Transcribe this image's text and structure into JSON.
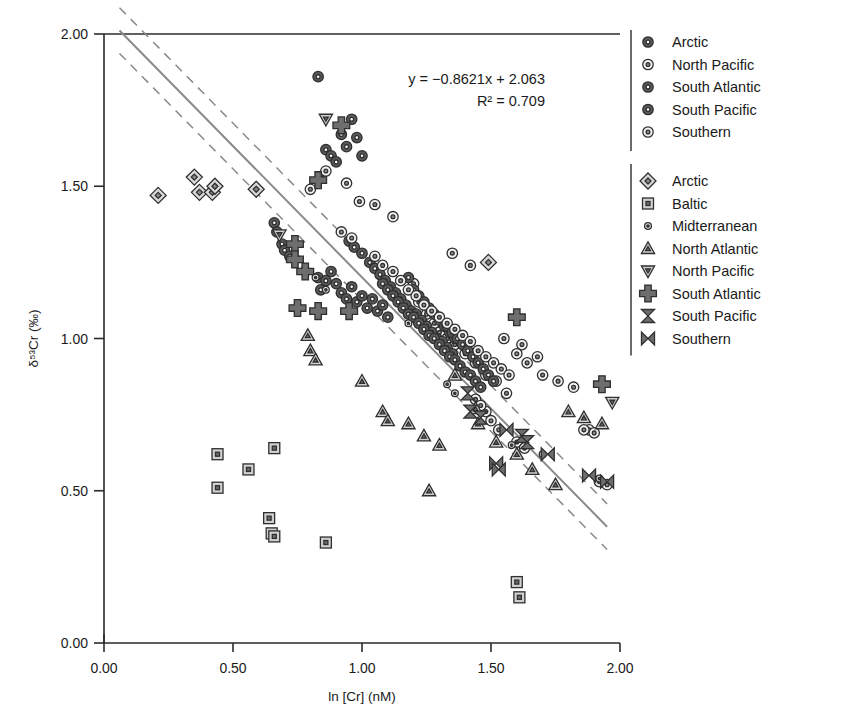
{
  "chart_data": {
    "type": "scatter",
    "title": "",
    "xlabel": "ln [Cr] (nM)",
    "ylabel": "δ⁵³Cr (‰)",
    "xlim": [
      0.0,
      2.0
    ],
    "ylim": [
      0.0,
      2.0
    ],
    "xticks": [
      "0.00",
      "0.50",
      "1.00",
      "1.50",
      "2.00"
    ],
    "yticks": [
      "0.00",
      "0.50",
      "1.00",
      "1.50",
      "2.00"
    ],
    "xtick_values": [
      0.0,
      0.5,
      1.0,
      1.5,
      2.0
    ],
    "ytick_values": [
      0.0,
      0.5,
      1.0,
      1.5,
      2.0
    ],
    "grid": false,
    "annotations": {
      "equation": "y = −0.8621x + 2.063",
      "r_squared": "R² = 0.709"
    },
    "regression": {
      "slope": -0.8621,
      "intercept": 2.063,
      "r2": 0.709,
      "x_start": 0.06,
      "x_end": 1.95,
      "confidence_band_offset": 0.075,
      "line_color": "#8a8a8a",
      "band_color": "#8a8a8a",
      "band_style": "dashed"
    },
    "legend": {
      "position": "right",
      "groups": [
        {
          "name": "circles",
          "entries": [
            {
              "label": "Arctic",
              "marker": "circle-dark"
            },
            {
              "label": "North Pacific",
              "marker": "circle-open"
            },
            {
              "label": "South Atlantic",
              "marker": "circle-dark"
            },
            {
              "label": "South Pacific",
              "marker": "circle-dark"
            },
            {
              "label": "Southern",
              "marker": "circle-open"
            }
          ]
        },
        {
          "name": "shapes",
          "entries": [
            {
              "label": "Arctic",
              "marker": "diamond"
            },
            {
              "label": "Baltic",
              "marker": "square"
            },
            {
              "label": "Midterranean",
              "marker": "circle-small"
            },
            {
              "label": "North Atlantic",
              "marker": "triangle-up"
            },
            {
              "label": "North Pacific",
              "marker": "triangle-down"
            },
            {
              "label": "South Atlantic",
              "marker": "plus"
            },
            {
              "label": "South Pacific",
              "marker": "hourglass-v"
            },
            {
              "label": "Southern",
              "marker": "bowtie-h"
            }
          ]
        }
      ]
    },
    "series": [
      {
        "name": "Arctic",
        "marker": "circle-dark",
        "points": [
          [
            0.66,
            1.38
          ],
          [
            0.67,
            1.35
          ],
          [
            0.69,
            1.31
          ],
          [
            0.7,
            1.29
          ],
          [
            0.72,
            1.27
          ],
          [
            0.83,
            1.2
          ],
          [
            0.84,
            1.16
          ],
          [
            0.86,
            1.19
          ],
          [
            0.88,
            1.22
          ],
          [
            0.9,
            1.18
          ],
          [
            0.92,
            1.15
          ],
          [
            0.94,
            1.13
          ],
          [
            0.96,
            1.17
          ],
          [
            0.98,
            1.12
          ],
          [
            1.0,
            1.14
          ],
          [
            1.02,
            1.1
          ],
          [
            1.04,
            1.13
          ],
          [
            1.06,
            1.09
          ],
          [
            1.08,
            1.11
          ],
          [
            1.1,
            1.07
          ],
          [
            0.84,
            1.53
          ],
          [
            0.86,
            1.62
          ],
          [
            0.88,
            1.6
          ],
          [
            0.9,
            1.58
          ],
          [
            0.92,
            1.67
          ],
          [
            0.94,
            1.63
          ],
          [
            0.96,
            1.72
          ],
          [
            0.98,
            1.66
          ],
          [
            1.0,
            1.6
          ],
          [
            0.83,
            1.86
          ]
        ]
      },
      {
        "name": "North Pacific",
        "marker": "circle-open",
        "points": [
          [
            0.8,
            1.49
          ],
          [
            0.86,
            1.55
          ],
          [
            0.94,
            1.51
          ],
          [
            0.99,
            1.45
          ],
          [
            1.05,
            1.44
          ],
          [
            1.12,
            1.4
          ],
          [
            1.2,
            1.18
          ],
          [
            1.22,
            1.12
          ],
          [
            1.25,
            1.08
          ],
          [
            1.28,
            1.05
          ],
          [
            1.3,
            1.02
          ],
          [
            1.33,
            1.0
          ],
          [
            1.36,
            0.98
          ],
          [
            1.4,
            0.95
          ],
          [
            1.44,
            0.92
          ],
          [
            1.48,
            0.88
          ],
          [
            1.52,
            0.86
          ],
          [
            1.56,
            0.82
          ],
          [
            1.6,
            0.95
          ],
          [
            1.64,
            0.92
          ],
          [
            1.7,
            0.88
          ],
          [
            1.76,
            0.86
          ],
          [
            1.82,
            0.84
          ],
          [
            1.88,
            0.7
          ],
          [
            1.9,
            0.69
          ],
          [
            1.55,
            1.0
          ],
          [
            1.62,
            0.98
          ],
          [
            1.68,
            0.94
          ],
          [
            1.35,
            1.28
          ],
          [
            1.42,
            1.24
          ]
        ]
      },
      {
        "name": "South Atlantic",
        "marker": "circle-dark",
        "points": [
          [
            0.95,
            1.32
          ],
          [
            0.97,
            1.3
          ],
          [
            1.0,
            1.28
          ],
          [
            1.03,
            1.25
          ],
          [
            1.05,
            1.23
          ],
          [
            1.07,
            1.21
          ],
          [
            1.09,
            1.19
          ],
          [
            1.11,
            1.17
          ],
          [
            1.13,
            1.15
          ],
          [
            1.15,
            1.13
          ],
          [
            1.17,
            1.11
          ],
          [
            1.19,
            1.09
          ],
          [
            1.21,
            1.08
          ],
          [
            1.23,
            1.06
          ],
          [
            1.25,
            1.04
          ],
          [
            1.27,
            1.02
          ],
          [
            1.29,
            1.0
          ],
          [
            1.31,
            0.99
          ],
          [
            1.33,
            0.97
          ],
          [
            1.35,
            0.95
          ],
          [
            1.18,
            1.2
          ],
          [
            1.2,
            1.16
          ],
          [
            1.22,
            1.14
          ],
          [
            1.24,
            1.12
          ],
          [
            1.26,
            1.1
          ],
          [
            1.28,
            1.08
          ],
          [
            1.3,
            1.06
          ],
          [
            1.32,
            1.04
          ],
          [
            1.34,
            1.02
          ],
          [
            1.36,
            1.0
          ]
        ]
      },
      {
        "name": "South Pacific",
        "marker": "circle-dark",
        "points": [
          [
            1.08,
            1.18
          ],
          [
            1.1,
            1.16
          ],
          [
            1.12,
            1.14
          ],
          [
            1.14,
            1.12
          ],
          [
            1.16,
            1.1
          ],
          [
            1.18,
            1.08
          ],
          [
            1.2,
            1.07
          ],
          [
            1.22,
            1.05
          ],
          [
            1.24,
            1.03
          ],
          [
            1.26,
            1.01
          ],
          [
            1.28,
            1.0
          ],
          [
            1.3,
            0.98
          ],
          [
            1.32,
            0.96
          ],
          [
            1.34,
            0.94
          ],
          [
            1.36,
            0.93
          ],
          [
            1.38,
            0.91
          ],
          [
            1.4,
            0.89
          ],
          [
            1.42,
            0.88
          ],
          [
            1.44,
            0.86
          ],
          [
            1.46,
            0.84
          ],
          [
            1.33,
            1.04
          ],
          [
            1.35,
            1.02
          ],
          [
            1.37,
            1.0
          ],
          [
            1.39,
            0.98
          ],
          [
            1.41,
            0.96
          ],
          [
            1.43,
            0.94
          ],
          [
            1.45,
            0.92
          ],
          [
            1.47,
            0.9
          ],
          [
            1.49,
            0.88
          ],
          [
            1.51,
            0.86
          ]
        ]
      },
      {
        "name": "Southern",
        "marker": "circle-open",
        "points": [
          [
            1.12,
            1.22
          ],
          [
            1.15,
            1.19
          ],
          [
            1.18,
            1.16
          ],
          [
            1.21,
            1.14
          ],
          [
            1.24,
            1.11
          ],
          [
            1.27,
            1.09
          ],
          [
            1.3,
            1.07
          ],
          [
            1.33,
            1.05
          ],
          [
            1.36,
            1.03
          ],
          [
            1.39,
            1.01
          ],
          [
            1.42,
            0.99
          ],
          [
            1.45,
            0.96
          ],
          [
            1.48,
            0.94
          ],
          [
            1.51,
            0.92
          ],
          [
            1.54,
            0.9
          ],
          [
            1.57,
            0.88
          ],
          [
            1.05,
            1.27
          ],
          [
            1.08,
            1.24
          ],
          [
            0.92,
            1.35
          ],
          [
            0.96,
            1.33
          ],
          [
            1.48,
            0.76
          ],
          [
            1.5,
            0.73
          ],
          [
            1.53,
            0.7
          ],
          [
            1.44,
            0.8
          ],
          [
            1.46,
            0.78
          ],
          [
            1.6,
            0.66
          ],
          [
            1.63,
            0.64
          ],
          [
            1.86,
            0.7
          ],
          [
            1.92,
            0.53
          ],
          [
            1.95,
            0.52
          ]
        ]
      },
      {
        "name": "Arctic",
        "marker": "diamond",
        "points": [
          [
            0.21,
            1.47
          ],
          [
            0.35,
            1.53
          ],
          [
            0.37,
            1.48
          ],
          [
            0.42,
            1.48
          ],
          [
            0.43,
            1.5
          ],
          [
            0.59,
            1.49
          ],
          [
            1.49,
            1.25
          ]
        ]
      },
      {
        "name": "Baltic",
        "marker": "square",
        "points": [
          [
            0.44,
            0.62
          ],
          [
            0.44,
            0.51
          ],
          [
            0.56,
            0.57
          ],
          [
            0.66,
            0.64
          ],
          [
            0.64,
            0.41
          ],
          [
            0.65,
            0.36
          ],
          [
            0.66,
            0.35
          ],
          [
            0.86,
            0.33
          ],
          [
            1.6,
            0.2
          ],
          [
            1.61,
            0.15
          ]
        ]
      },
      {
        "name": "Midterranean",
        "marker": "circle-small",
        "points": [
          [
            0.75,
            1.26
          ],
          [
            0.78,
            1.23
          ],
          [
            0.82,
            1.2
          ],
          [
            0.86,
            1.16
          ],
          [
            1.18,
            1.05
          ],
          [
            1.33,
            0.85
          ],
          [
            1.36,
            0.82
          ],
          [
            1.58,
            0.65
          ],
          [
            1.7,
            0.62
          ],
          [
            1.92,
            0.54
          ]
        ]
      },
      {
        "name": "North Atlantic",
        "marker": "triangle-up",
        "points": [
          [
            0.79,
            1.01
          ],
          [
            0.8,
            0.96
          ],
          [
            0.82,
            0.93
          ],
          [
            1.0,
            0.86
          ],
          [
            1.08,
            0.76
          ],
          [
            1.1,
            0.73
          ],
          [
            1.18,
            0.72
          ],
          [
            1.24,
            0.68
          ],
          [
            1.3,
            0.65
          ],
          [
            1.26,
            0.5
          ],
          [
            1.44,
            0.77
          ],
          [
            1.45,
            0.72
          ],
          [
            1.52,
            0.66
          ],
          [
            1.6,
            0.62
          ],
          [
            1.66,
            0.57
          ],
          [
            1.75,
            0.52
          ],
          [
            1.8,
            0.76
          ],
          [
            1.86,
            0.74
          ],
          [
            1.93,
            0.72
          ],
          [
            1.36,
            0.88
          ]
        ]
      },
      {
        "name": "North Pacific",
        "marker": "triangle-down",
        "points": [
          [
            0.68,
            1.34
          ],
          [
            0.86,
            1.72
          ],
          [
            1.97,
            0.79
          ]
        ]
      },
      {
        "name": "South Atlantic",
        "marker": "plus",
        "points": [
          [
            0.74,
            1.31
          ],
          [
            0.74,
            1.26
          ],
          [
            0.78,
            1.22
          ],
          [
            0.83,
            1.52
          ],
          [
            0.92,
            1.7
          ],
          [
            0.75,
            1.1
          ],
          [
            0.83,
            1.09
          ],
          [
            0.95,
            1.09
          ],
          [
            1.6,
            1.07
          ],
          [
            1.93,
            0.85
          ]
        ]
      },
      {
        "name": "South Pacific",
        "marker": "hourglass-v",
        "points": [
          [
            1.41,
            0.82
          ],
          [
            1.42,
            0.76
          ],
          [
            1.46,
            0.74
          ],
          [
            1.62,
            0.68
          ],
          [
            1.64,
            0.66
          ]
        ]
      },
      {
        "name": "Southern",
        "marker": "bowtie-h",
        "points": [
          [
            1.52,
            0.59
          ],
          [
            1.53,
            0.57
          ],
          [
            1.56,
            0.7
          ],
          [
            1.72,
            0.62
          ],
          [
            1.88,
            0.55
          ],
          [
            1.95,
            0.53
          ]
        ]
      }
    ]
  }
}
